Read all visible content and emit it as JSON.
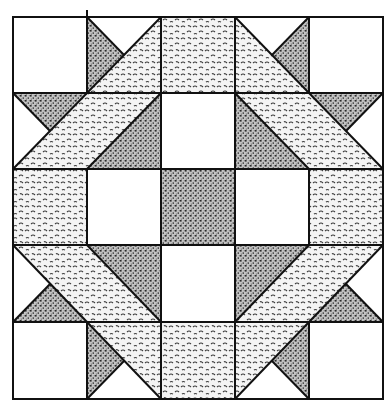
{
  "figure": {
    "grid": {
      "columns": 5,
      "rows": 5
    },
    "colors": {
      "background": "#ffffff",
      "outline": "#111111",
      "light_print_bg": "#f2f2f2",
      "light_print_ink": "#3a3a3a",
      "dark_print_bg": "#bdbdbd",
      "dark_print_ink": "#2a2a2a"
    },
    "fabrics": [
      "white",
      "light-squiggle-print",
      "dark-stipple-print"
    ]
  }
}
